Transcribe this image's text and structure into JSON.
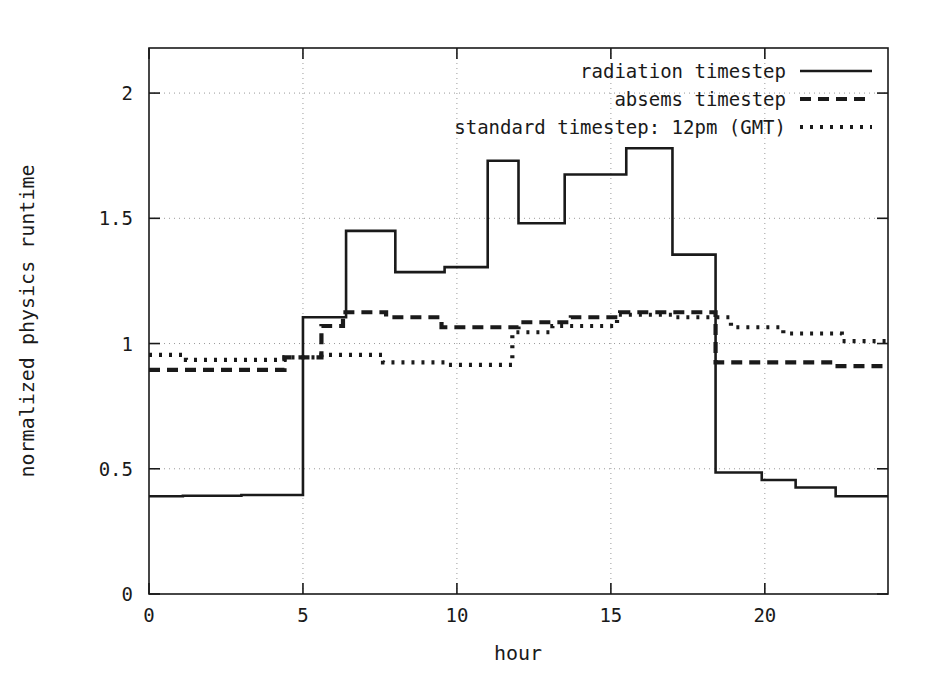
{
  "chart_data": {
    "type": "line",
    "title": "",
    "xlabel": "hour",
    "ylabel": "normalized physics runtime",
    "xlim": [
      0,
      24
    ],
    "ylim": [
      0,
      2.18
    ],
    "xticks": [
      0,
      5,
      10,
      15,
      20
    ],
    "xtick_labels": [
      "0",
      "5",
      "10",
      "15",
      "20"
    ],
    "yticks": [
      0,
      0.5,
      1,
      1.5,
      2
    ],
    "ytick_labels": [
      "0",
      "0.5",
      "1",
      "1.5",
      "2"
    ],
    "grid": true,
    "grid_axis": "y-and-x",
    "legend_position": "top-center",
    "step_style": "post",
    "series": [
      {
        "name": "radiation timestep",
        "style": "solid",
        "x": [
          0,
          1,
          2,
          3,
          4,
          5,
          5,
          6,
          6.4,
          6.4,
          8,
          8,
          9.5,
          11,
          11,
          12,
          12,
          13.5,
          13.5,
          15.5,
          15.5,
          17,
          17,
          18.4,
          18.4,
          19.9,
          21,
          22.2,
          23.2,
          24
        ],
        "values": [
          0.39,
          0.39,
          0.392,
          0.395,
          0.395,
          0.395,
          1.105,
          1.105,
          1.105,
          1.45,
          1.45,
          1.285,
          1.285,
          1.305,
          1.73,
          1.73,
          1.48,
          1.48,
          1.675,
          1.675,
          1.78,
          1.78,
          1.355,
          1.355,
          0.485,
          0.485,
          0.455,
          0.425,
          0.39,
          0.39
        ],
        "points": [
          {
            "x0": 0,
            "x1": 1.1,
            "y": 0.39
          },
          {
            "x0": 1.1,
            "x1": 3.0,
            "y": 0.392
          },
          {
            "x0": 3.0,
            "x1": 5.0,
            "y": 0.395
          },
          {
            "x0": 5.0,
            "x1": 6.4,
            "y": 1.105
          },
          {
            "x0": 6.4,
            "x1": 8.0,
            "y": 1.45
          },
          {
            "x0": 8.0,
            "x1": 9.6,
            "y": 1.285
          },
          {
            "x0": 9.6,
            "x1": 11.0,
            "y": 1.305
          },
          {
            "x0": 11.0,
            "x1": 12.0,
            "y": 1.73
          },
          {
            "x0": 12.0,
            "x1": 13.5,
            "y": 1.48
          },
          {
            "x0": 13.5,
            "x1": 15.5,
            "y": 1.675
          },
          {
            "x0": 15.5,
            "x1": 17.0,
            "y": 1.78
          },
          {
            "x0": 17.0,
            "x1": 18.4,
            "y": 1.355
          },
          {
            "x0": 18.4,
            "x1": 19.9,
            "y": 0.485
          },
          {
            "x0": 19.9,
            "x1": 21.0,
            "y": 0.455
          },
          {
            "x0": 21.0,
            "x1": 22.3,
            "y": 0.425
          },
          {
            "x0": 22.3,
            "x1": 24.0,
            "y": 0.39
          }
        ]
      },
      {
        "name": "absems timestep",
        "style": "dashed",
        "points": [
          {
            "x0": 0,
            "x1": 4.4,
            "y": 0.895
          },
          {
            "x0": 4.4,
            "x1": 5.6,
            "y": 0.945
          },
          {
            "x0": 5.6,
            "x1": 6.3,
            "y": 1.07
          },
          {
            "x0": 6.3,
            "x1": 7.7,
            "y": 1.125
          },
          {
            "x0": 7.7,
            "x1": 9.5,
            "y": 1.105
          },
          {
            "x0": 9.5,
            "x1": 12.0,
            "y": 1.065
          },
          {
            "x0": 12.0,
            "x1": 13.7,
            "y": 1.085
          },
          {
            "x0": 13.7,
            "x1": 15.3,
            "y": 1.105
          },
          {
            "x0": 15.3,
            "x1": 18.4,
            "y": 1.125
          },
          {
            "x0": 18.4,
            "x1": 22.2,
            "y": 0.925
          },
          {
            "x0": 22.2,
            "x1": 24.0,
            "y": 0.91
          }
        ]
      },
      {
        "name": "standard timestep: 12pm (GMT)",
        "style": "dotted",
        "points": [
          {
            "x0": 0,
            "x1": 1.2,
            "y": 0.955
          },
          {
            "x0": 1.2,
            "x1": 4.4,
            "y": 0.935
          },
          {
            "x0": 4.4,
            "x1": 5.6,
            "y": 0.945
          },
          {
            "x0": 5.6,
            "x1": 7.6,
            "y": 0.955
          },
          {
            "x0": 7.6,
            "x1": 9.6,
            "y": 0.925
          },
          {
            "x0": 9.6,
            "x1": 11.8,
            "y": 0.915
          },
          {
            "x0": 11.8,
            "x1": 13.1,
            "y": 1.045
          },
          {
            "x0": 13.1,
            "x1": 15.2,
            "y": 1.07
          },
          {
            "x0": 15.2,
            "x1": 17.1,
            "y": 1.115
          },
          {
            "x0": 17.1,
            "x1": 18.9,
            "y": 1.105
          },
          {
            "x0": 18.9,
            "x1": 20.6,
            "y": 1.065
          },
          {
            "x0": 20.6,
            "x1": 22.5,
            "y": 1.04
          },
          {
            "x0": 22.5,
            "x1": 24.0,
            "y": 1.01
          }
        ]
      }
    ]
  },
  "legend": {
    "entries": [
      {
        "label": "radiation timestep",
        "style": "solid"
      },
      {
        "label": "absems timestep",
        "style": "dashed"
      },
      {
        "label": "standard timestep: 12pm (GMT)",
        "style": "dotted"
      }
    ]
  },
  "axes": {
    "x_title": "hour",
    "y_title": "normalized physics runtime"
  },
  "colors": {
    "line": "#1a1a1a",
    "grid": "#9a9a9a",
    "frame": "#1a1a1a",
    "background": "#ffffff"
  }
}
